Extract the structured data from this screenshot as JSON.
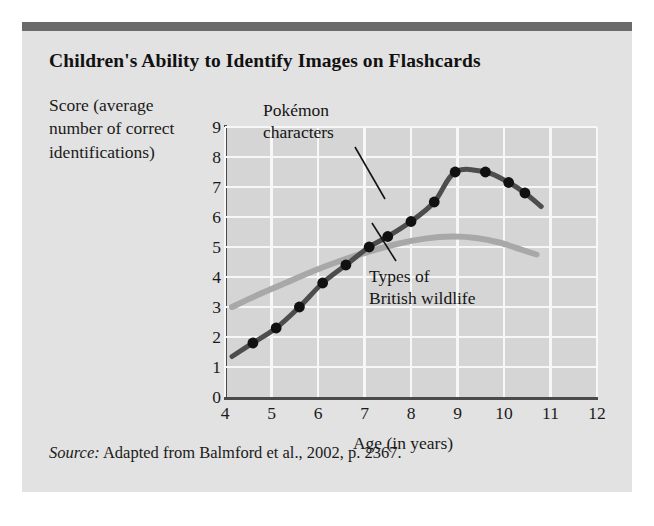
{
  "figure": {
    "title": "Children's Ability to Identify Images on Flashcards",
    "source_prefix": "Source:",
    "source_text": " Adapted from Balmford et al., 2002, p. 2367."
  },
  "chart_data": {
    "type": "line",
    "title": "Children's Ability to Identify Images on Flashcards",
    "xlabel": "Age (in years)",
    "ylabel": "Score (average number of correct identifications)",
    "xlim": [
      4,
      12
    ],
    "ylim": [
      0,
      9
    ],
    "xticks": [
      4,
      5,
      6,
      7,
      8,
      9,
      10,
      11,
      12
    ],
    "yticks": [
      0,
      1,
      2,
      3,
      4,
      5,
      6,
      7,
      8,
      9
    ],
    "grid": true,
    "legend": "annotations",
    "annotations": [
      {
        "name": "pokemon-label",
        "text_line1": "Pokémon",
        "text_line2": "characters",
        "points_to_series": "Pokémon characters"
      },
      {
        "name": "wildlife-label",
        "text_line1": "Types of",
        "text_line2": "British wildlife",
        "points_to_series": "Types of British wildlife"
      }
    ],
    "series": [
      {
        "name": "Pokémon characters",
        "color": "#4d4d4d",
        "marker": "filled-circle",
        "marker_color": "#111111",
        "x": [
          4.15,
          4.6,
          5.1,
          5.6,
          6.1,
          6.6,
          7.1,
          7.5,
          8.0,
          8.5,
          8.95,
          9.6,
          10.1,
          10.45,
          10.8
        ],
        "y": [
          1.35,
          1.8,
          2.3,
          3.0,
          3.8,
          4.4,
          5.0,
          5.35,
          5.85,
          6.5,
          7.5,
          7.5,
          7.15,
          6.8,
          6.35
        ],
        "markers_at": [
          4.6,
          5.1,
          5.6,
          6.1,
          6.6,
          7.1,
          7.5,
          8.0,
          8.5,
          8.95,
          9.6,
          10.1,
          10.45
        ]
      },
      {
        "name": "Types of British wildlife",
        "color": "#a8a8a8",
        "marker": "none",
        "x": [
          4.15,
          4.7,
          5.3,
          5.9,
          6.5,
          7.1,
          7.7,
          8.3,
          8.9,
          9.4,
          9.9,
          10.4,
          10.7
        ],
        "y": [
          3.0,
          3.4,
          3.8,
          4.2,
          4.55,
          4.85,
          5.1,
          5.28,
          5.35,
          5.3,
          5.15,
          4.9,
          4.75
        ]
      }
    ]
  },
  "axes": {
    "y_labels": [
      "9",
      "8",
      "7",
      "6",
      "5",
      "4",
      "3",
      "2",
      "1",
      "0"
    ],
    "x_labels": [
      "4",
      "5",
      "6",
      "7",
      "8",
      "9",
      "10",
      "11",
      "12"
    ],
    "x_title": "Age (in years)",
    "y_title": "Score (average number of correct identifications)"
  },
  "labels": {
    "pokemon_line1": "Pokémon",
    "pokemon_line2": "characters",
    "wildlife_line1": "Types of",
    "wildlife_line2": "British wildlife"
  }
}
